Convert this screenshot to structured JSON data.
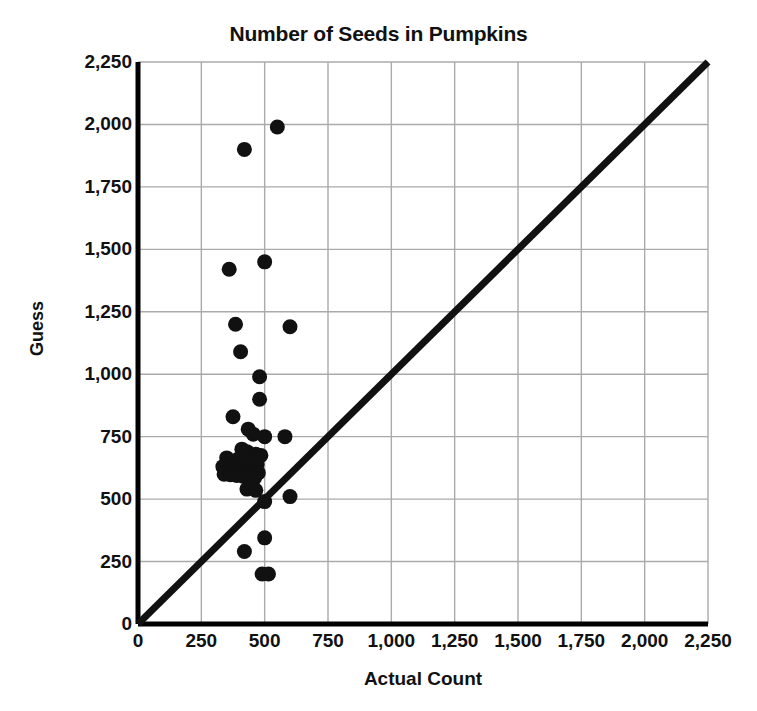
{
  "chart_data": {
    "type": "scatter",
    "title": "Number of Seeds in Pumpkins",
    "xlabel": "Actual Count",
    "ylabel": "Guess",
    "xlim": [
      0,
      2250
    ],
    "ylim": [
      0,
      2250
    ],
    "xticks": [
      "0",
      "250",
      "500",
      "750",
      "1,000",
      "1,250",
      "1,500",
      "1,750",
      "2,000",
      "2,250"
    ],
    "yticks": [
      "0",
      "250",
      "500",
      "750",
      "1,000",
      "1,250",
      "1,500",
      "1,750",
      "2,000",
      "2,250"
    ],
    "xtick_values": [
      0,
      250,
      500,
      750,
      1000,
      1250,
      1500,
      1750,
      2000,
      2250
    ],
    "ytick_values": [
      0,
      250,
      500,
      750,
      1000,
      1250,
      1500,
      1750,
      2000,
      2250
    ],
    "grid": true,
    "legend": "none",
    "marker_color": "#111111",
    "grid_color": "#aaaaaa",
    "axis_color": "#000000",
    "reference_line": {
      "name": "y = x identity line",
      "from": [
        0,
        0
      ],
      "to": [
        2250,
        2250
      ],
      "color": "#111111",
      "width": 7
    },
    "series": [
      {
        "name": "Pumpkin seed guesses",
        "points": [
          [
            550,
            1990
          ],
          [
            420,
            1900
          ],
          [
            500,
            1450
          ],
          [
            360,
            1420
          ],
          [
            385,
            1200
          ],
          [
            600,
            1190
          ],
          [
            405,
            1090
          ],
          [
            480,
            990
          ],
          [
            480,
            900
          ],
          [
            375,
            830
          ],
          [
            435,
            780
          ],
          [
            455,
            760
          ],
          [
            500,
            750
          ],
          [
            580,
            750
          ],
          [
            410,
            700
          ],
          [
            430,
            690
          ],
          [
            465,
            680
          ],
          [
            485,
            675
          ],
          [
            350,
            665
          ],
          [
            395,
            660
          ],
          [
            420,
            650
          ],
          [
            445,
            645
          ],
          [
            470,
            640
          ],
          [
            335,
            630
          ],
          [
            360,
            625
          ],
          [
            380,
            620
          ],
          [
            400,
            615
          ],
          [
            425,
            612
          ],
          [
            450,
            608
          ],
          [
            475,
            605
          ],
          [
            340,
            600
          ],
          [
            365,
            598
          ],
          [
            390,
            595
          ],
          [
            415,
            592
          ],
          [
            440,
            588
          ],
          [
            460,
            585
          ],
          [
            430,
            540
          ],
          [
            465,
            535
          ],
          [
            600,
            510
          ],
          [
            500,
            490
          ],
          [
            500,
            345
          ],
          [
            420,
            290
          ],
          [
            490,
            200
          ],
          [
            515,
            200
          ]
        ]
      }
    ]
  },
  "plot_geometry": {
    "left": 138,
    "top": 62,
    "right": 708,
    "bottom": 624,
    "marker_radius": 7.5
  }
}
